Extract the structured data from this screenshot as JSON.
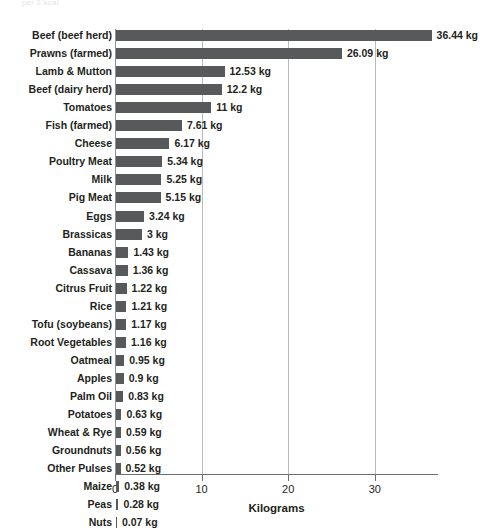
{
  "faint_caption": "per 2 kcal",
  "colors": {
    "bar": "#58595b",
    "text": "#231f20",
    "gridline": "#b9bcbe",
    "axis": "#6c6f71",
    "background": "#ffffff"
  },
  "chart_data": {
    "type": "bar",
    "orientation": "horizontal",
    "title": "",
    "subtitle": "",
    "xlabel": "Kilograms",
    "ylabel": "",
    "xlim": [
      0,
      37.3
    ],
    "xticks": [
      0,
      10,
      20,
      30
    ],
    "xtick_labels": [
      "0",
      "10",
      "20",
      "30"
    ],
    "grid": true,
    "grid_axis": "x",
    "legend": false,
    "unit_suffix": "kg",
    "categories": [
      "Beef (beef herd)",
      "Prawns (farmed)",
      "Lamb & Mutton",
      "Beef (dairy herd)",
      "Tomatoes",
      "Fish (farmed)",
      "Cheese",
      "Poultry Meat",
      "Milk",
      "Pig Meat",
      "Eggs",
      "Brassicas",
      "Bananas",
      "Cassava",
      "Citrus Fruit",
      "Rice",
      "Tofu (soybeans)",
      "Root Vegetables",
      "Oatmeal",
      "Apples",
      "Palm Oil",
      "Potatoes",
      "Wheat & Rye",
      "Groundnuts",
      "Other Pulses",
      "Maize",
      "Peas",
      "Nuts"
    ],
    "values": [
      36.44,
      26.09,
      12.53,
      12.2,
      11,
      7.61,
      6.17,
      5.34,
      5.25,
      5.15,
      3.24,
      3,
      1.43,
      1.36,
      1.22,
      1.21,
      1.17,
      1.16,
      0.95,
      0.9,
      0.83,
      0.63,
      0.59,
      0.56,
      0.52,
      0.38,
      0.28,
      0.07
    ],
    "value_labels": [
      "36.44 kg",
      "26.09 kg",
      "12.53 kg",
      "12.2 kg",
      "11 kg",
      "7.61 kg",
      "6.17 kg",
      "5.34 kg",
      "5.25 kg",
      "5.15 kg",
      "3.24 kg",
      "3 kg",
      "1.43 kg",
      "1.36 kg",
      "1.22 kg",
      "1.21 kg",
      "1.17 kg",
      "1.16 kg",
      "0.95 kg",
      "0.9 kg",
      "0.83 kg",
      "0.63 kg",
      "0.59 kg",
      "0.56 kg",
      "0.52 kg",
      "0.38 kg",
      "0.28 kg",
      "0.07 kg"
    ]
  }
}
